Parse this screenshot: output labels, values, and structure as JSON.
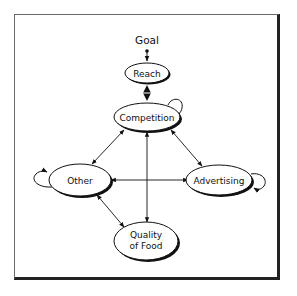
{
  "diagram": {
    "title_node": "Goal",
    "nodes": [
      {
        "id": "reach",
        "label": "Reach"
      },
      {
        "id": "competition",
        "label": "Competition"
      },
      {
        "id": "other",
        "label": "Other"
      },
      {
        "id": "advertising",
        "label": "Advertising"
      },
      {
        "id": "quality",
        "label_line1": "Quality",
        "label_line2": "of Food"
      }
    ],
    "edges": [
      {
        "from": "Goal",
        "to": "Reach",
        "type": "arrow"
      },
      {
        "from": "Reach",
        "to": "Competition",
        "type": "bidirectional-diamond"
      },
      {
        "from": "Competition",
        "to": "Competition",
        "type": "self-loop"
      },
      {
        "from": "Competition",
        "to": "Other",
        "type": "bidirectional"
      },
      {
        "from": "Competition",
        "to": "Advertising",
        "type": "bidirectional"
      },
      {
        "from": "Competition",
        "to": "Quality of Food",
        "type": "bidirectional"
      },
      {
        "from": "Other",
        "to": "Advertising",
        "type": "bidirectional"
      },
      {
        "from": "Other",
        "to": "Quality of Food",
        "type": "bidirectional"
      },
      {
        "from": "Other",
        "to": "Other",
        "type": "self-loop"
      },
      {
        "from": "Advertising",
        "to": "Advertising",
        "type": "self-loop"
      }
    ],
    "colors": {
      "stroke": "#111111",
      "background": "#ffffff",
      "frame_light": "#6a6a6a",
      "frame_dark": "#222222"
    }
  }
}
